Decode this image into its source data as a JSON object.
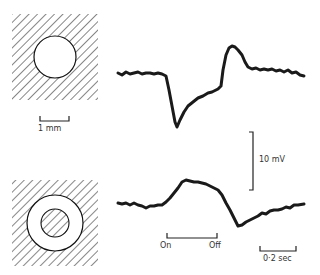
{
  "figure": {
    "panels": [
      {
        "id": "center-spot",
        "stimulus": "light spot in receptive field center",
        "trace_description": "hyperpolarizing during light on, depolarizing rebound at off"
      },
      {
        "id": "annulus",
        "stimulus": "light annulus surrounding center",
        "trace_description": "depolarizing during light on, hyperpolarizing at off"
      }
    ],
    "scale_labels": {
      "distance": "1 mm",
      "voltage": "10 mV",
      "time": "0·2 sec"
    },
    "stimulus_labels": {
      "on": "On",
      "off": "Off"
    },
    "colors": {
      "ink": "#1a1a1a",
      "background": "#ffffff"
    }
  }
}
